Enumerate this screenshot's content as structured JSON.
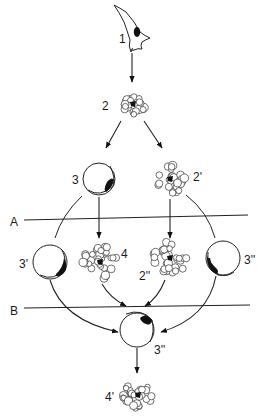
{
  "diagram": {
    "type": "cell differentiation scheme",
    "colors": {
      "ink": "#1a1a1a",
      "background": "#ffffff"
    },
    "nodes": [
      {
        "id": "1",
        "label": "1",
        "kind": "fibroblast-like cell"
      },
      {
        "id": "2",
        "label": "2",
        "kind": "cell cluster"
      },
      {
        "id": "3",
        "label": "3",
        "kind": "round cell with crescent"
      },
      {
        "id": "2p",
        "label": "2'",
        "kind": "cell cluster"
      },
      {
        "id": "3p",
        "label": "3'",
        "kind": "round cell with crescent"
      },
      {
        "id": "4",
        "label": "4",
        "kind": "cell cluster"
      },
      {
        "id": "2pp",
        "label": "2''",
        "kind": "cell cluster"
      },
      {
        "id": "3pp_right",
        "label": "3''",
        "kind": "round cell with crescent"
      },
      {
        "id": "3pp_bottom",
        "label": "3''",
        "kind": "round cell with crescent"
      },
      {
        "id": "4p",
        "label": "4'",
        "kind": "cell cluster"
      }
    ],
    "barriers": [
      {
        "id": "A",
        "label": "A"
      },
      {
        "id": "B",
        "label": "B"
      }
    ],
    "edges": [
      {
        "from": "1",
        "to": "2"
      },
      {
        "from": "2",
        "to": "3"
      },
      {
        "from": "2",
        "to": "2p"
      },
      {
        "from": "3",
        "to": "3p"
      },
      {
        "from": "3",
        "to": "4"
      },
      {
        "from": "2p",
        "to": "2pp"
      },
      {
        "from": "2p",
        "to": "3pp_right"
      },
      {
        "from": "3p",
        "to": "3pp_bottom"
      },
      {
        "from": "4",
        "to": "3pp_bottom"
      },
      {
        "from": "2pp",
        "to": "3pp_bottom"
      },
      {
        "from": "3pp_right",
        "to": "3pp_bottom"
      },
      {
        "from": "3pp_bottom",
        "to": "4p"
      }
    ]
  }
}
